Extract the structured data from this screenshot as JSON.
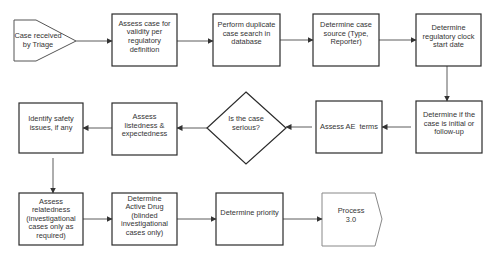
{
  "diagram": {
    "colors": {
      "box_stroke": "#2b2b2b",
      "terminal_stroke": "#555555",
      "end_stroke": "#888888",
      "arrow": "#333333",
      "text": "#333333",
      "background": "#ffffff"
    },
    "nodes": [
      {
        "id": "n1",
        "shape": "pentagon-start",
        "label": "Case received by Triage"
      },
      {
        "id": "n2",
        "shape": "box",
        "label": "Assess case for validity per regulatory definition"
      },
      {
        "id": "n3",
        "shape": "box",
        "label": "Perform duplicate case search in database"
      },
      {
        "id": "n4",
        "shape": "box",
        "label": "Determine case source (Type, Reporter)"
      },
      {
        "id": "n5",
        "shape": "box",
        "label": "Determine regulatory clock start date"
      },
      {
        "id": "n6",
        "shape": "box",
        "label": "Determine if the case is initial or follow-up"
      },
      {
        "id": "n7",
        "shape": "box",
        "label": "Assess AE  terms"
      },
      {
        "id": "n8",
        "shape": "diamond",
        "label": "Is the case serious?"
      },
      {
        "id": "n9",
        "shape": "box",
        "label": "Assess listedness & expectedness"
      },
      {
        "id": "n10",
        "shape": "box",
        "label": "Identify safety issues, if any"
      },
      {
        "id": "n11",
        "shape": "box",
        "label": "Assess relatedness (investigational cases only as required)"
      },
      {
        "id": "n12",
        "shape": "box",
        "label": "Determine Active Drug (blinded investigational cases only)"
      },
      {
        "id": "n13",
        "shape": "box",
        "label": "Determine priority"
      },
      {
        "id": "n14",
        "shape": "pentagon-end",
        "label": "Process 3.0"
      }
    ],
    "edges": [
      {
        "from": "n1",
        "to": "n2"
      },
      {
        "from": "n2",
        "to": "n3"
      },
      {
        "from": "n3",
        "to": "n4"
      },
      {
        "from": "n4",
        "to": "n5"
      },
      {
        "from": "n5",
        "to": "n6"
      },
      {
        "from": "n6",
        "to": "n7"
      },
      {
        "from": "n7",
        "to": "n8"
      },
      {
        "from": "n8",
        "to": "n9"
      },
      {
        "from": "n9",
        "to": "n10"
      },
      {
        "from": "n10",
        "to": "n11"
      },
      {
        "from": "n11",
        "to": "n12"
      },
      {
        "from": "n12",
        "to": "n13"
      },
      {
        "from": "n13",
        "to": "n14"
      }
    ]
  }
}
